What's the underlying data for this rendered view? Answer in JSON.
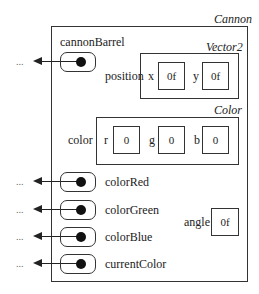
{
  "cannon": {
    "type_label": "Cannon",
    "fields": {
      "cannonBarrel": {
        "label": "cannonBarrel",
        "target": "..."
      },
      "position": {
        "label": "position",
        "type_label": "Vector2",
        "x_label": "x",
        "x_value": "0f",
        "y_label": "y",
        "y_value": "0f"
      },
      "color": {
        "label": "color",
        "type_label": "Color",
        "r_label": "r",
        "r_value": "0",
        "g_label": "g",
        "g_value": "0",
        "b_label": "b",
        "b_value": "0"
      },
      "colorRed": {
        "label": "colorRed",
        "target": "..."
      },
      "colorGreen": {
        "label": "colorGreen",
        "target": "..."
      },
      "colorBlue": {
        "label": "colorBlue",
        "target": "..."
      },
      "currentColor": {
        "label": "currentColor",
        "target": "..."
      },
      "angle": {
        "label": "angle",
        "value": "0f"
      }
    }
  }
}
